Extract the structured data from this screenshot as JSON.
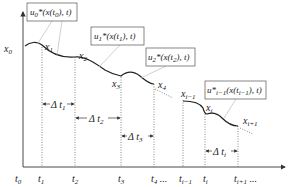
{
  "diagram": {
    "type": "piecewise trajectory timeline",
    "axes": {
      "y_start_label": "x",
      "y_start_sub": "0",
      "time_labels": [
        {
          "main": "t",
          "sub": "0",
          "suffix": "",
          "x": 17
        },
        {
          "main": "t",
          "sub": "1",
          "suffix": "",
          "x": 39
        },
        {
          "main": "t",
          "sub": "2",
          "suffix": "",
          "x": 73
        },
        {
          "main": "t",
          "sub": "3",
          "suffix": "",
          "x": 119
        },
        {
          "main": "t",
          "sub": "4",
          "suffix": " ...",
          "x": 152
        },
        {
          "main": "t",
          "sub": "i−1",
          "suffix": "",
          "x": 179
        },
        {
          "main": "t",
          "sub": "i",
          "suffix": "",
          "x": 204
        },
        {
          "main": "t",
          "sub": "i+1",
          "suffix": " ...",
          "x": 235
        }
      ]
    },
    "state_labels": [
      {
        "main": "x",
        "sub": "1",
        "x": 45,
        "y": 50
      },
      {
        "main": "x",
        "sub": "2",
        "x": 79,
        "y": 59
      },
      {
        "main": "x",
        "sub": "3",
        "x": 112,
        "y": 87
      },
      {
        "main": "x",
        "sub": "4",
        "x": 158,
        "y": 86
      },
      {
        "main": "x",
        "sub": "i−1",
        "x": 181,
        "y": 97
      },
      {
        "main": "x",
        "sub": "i",
        "x": 206,
        "y": 111
      },
      {
        "main": "x",
        "sub": "i+1",
        "x": 243,
        "y": 124
      }
    ],
    "control_boxes": [
      {
        "label": "u",
        "sub": "0",
        "rest": "*(x(t",
        "tsub": "0",
        "end": "), t)",
        "x": 27,
        "y": 3,
        "w": 50,
        "h": 18
      },
      {
        "label": "u",
        "sub": "1",
        "rest": "*(x(t",
        "tsub": "1",
        "end": "), t)",
        "x": 91,
        "y": 27,
        "w": 53,
        "h": 18
      },
      {
        "label": "u",
        "sub": "2",
        "rest": "*(x(t",
        "tsub": "2",
        "end": "), t)",
        "x": 146,
        "y": 48,
        "w": 49,
        "h": 18
      },
      {
        "label": "u*",
        "sub": "i−1",
        "rest": "(x(t",
        "tsub": "i−1",
        "end": "), t)",
        "x": 205,
        "y": 81,
        "w": 61,
        "h": 18
      }
    ],
    "intervals": [
      {
        "label": "Δ t",
        "sub": "1",
        "x1": 42,
        "x2": 75,
        "y": 104
      },
      {
        "label": "Δ t",
        "sub": "2",
        "x1": 75,
        "x2": 121,
        "y": 118
      },
      {
        "label": "Δ t",
        "sub": "3",
        "x1": 121,
        "x2": 154,
        "y": 136
      },
      {
        "label": "Δ t",
        "sub": "i",
        "x1": 205,
        "x2": 238,
        "y": 151
      }
    ]
  }
}
